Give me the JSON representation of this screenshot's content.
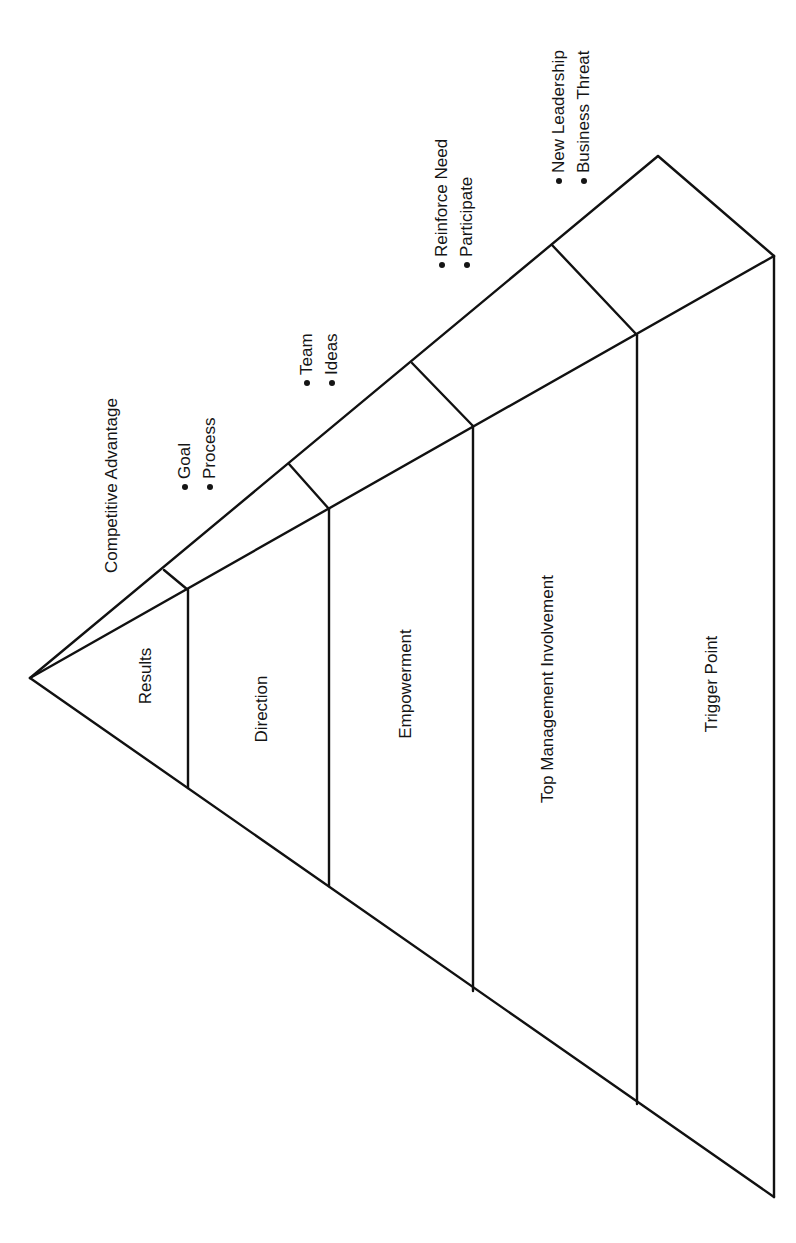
{
  "diagram": {
    "title_label": "Competitive Advantage",
    "layers": [
      {
        "name": "Results",
        "bullets": [
          "Goal",
          "Process"
        ]
      },
      {
        "name": "Direction",
        "bullets": [
          "Team",
          "Ideas"
        ]
      },
      {
        "name": "Empowerment",
        "bullets": [
          "Reinforce Need",
          "Participate"
        ]
      },
      {
        "name": "Top Management Involvement",
        "bullets": [
          "New Leadership",
          "Business Threat"
        ]
      },
      {
        "name": "Trigger Point",
        "bullets": []
      }
    ],
    "line_color": "#111111",
    "background": "#ffffff"
  }
}
